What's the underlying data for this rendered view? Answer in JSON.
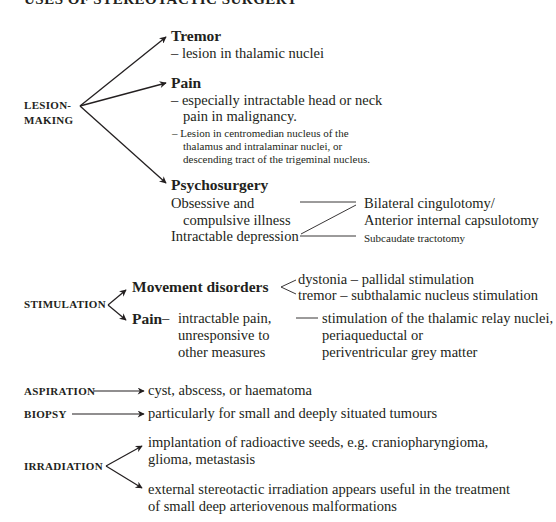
{
  "title": "USES OF STEREOTACTIC SURGERY",
  "lesion_making": {
    "label_line1": "LESION-",
    "label_line2": "MAKING",
    "tremor": {
      "heading": "Tremor",
      "desc": "– lesion in thalamic nuclei"
    },
    "pain": {
      "heading": "Pain",
      "desc_line1": "– especially intractable head or neck",
      "desc_line2": "pain in malignancy.",
      "note_line1": "– Lesion in centromedian nucleus of the",
      "note_line2": "thalamus and intralaminar nuclei, or",
      "note_line3": "descending tract of the trigeminal nucleus."
    },
    "psychosurgery": {
      "heading": "Psychosurgery",
      "indication1_line1": "Obsessive and",
      "indication1_line2": "compulsive illness",
      "indication2": "Intractable depression",
      "procedure1_line1": "Bilateral cingulotomy/",
      "procedure1_line2": "Anterior internal capsulotomy",
      "procedure2": "Subcaudate tractotomy"
    }
  },
  "stimulation": {
    "label": "STIMULATION",
    "movement": {
      "heading": "Movement disorders",
      "item1": "dystonia – pallidal stimulation",
      "item2": "tremor – subthalamic nucleus stimulation"
    },
    "pain": {
      "heading": "Pain",
      "dash": "–",
      "desc_line1": "intractable pain,",
      "desc_line2": "unresponsive to",
      "desc_line3": "other measures",
      "target_line1": "stimulation of the thalamic relay nuclei,",
      "target_line2": "periaqueductal or",
      "target_line3": "periventricular grey matter"
    }
  },
  "aspiration": {
    "label": "ASPIRATION",
    "desc": "cyst, abscess, or haematoma"
  },
  "biopsy": {
    "label": "BIOPSY",
    "desc": "particularly for small and deeply situated tumours"
  },
  "irradiation": {
    "label": "IRRADIATION",
    "item1_line1": "implantation of radioactive seeds, e.g. craniopharyngioma,",
    "item1_line2": "glioma, metastasis",
    "item2_line1": "external stereotactic irradiation appears useful in the treatment",
    "item2_line2": "of small deep arteriovenous malformations"
  }
}
